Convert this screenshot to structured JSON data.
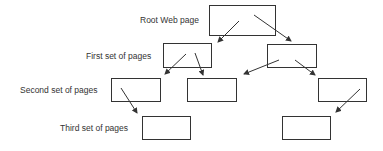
{
  "diagram": {
    "labels": {
      "root": "Root Web page",
      "first": "First set of pages",
      "second": "Second set of pages",
      "third": "Third set of pages"
    },
    "colors": {
      "stroke": "#333333",
      "text": "#333333",
      "background": "#ffffff"
    },
    "levels": [
      {
        "name": "Root Web page",
        "nodes": 1
      },
      {
        "name": "First set of pages",
        "nodes": 2
      },
      {
        "name": "Second set of pages",
        "nodes": 3
      },
      {
        "name": "Third set of pages",
        "nodes": 2
      }
    ],
    "edges": [
      [
        "root",
        "first-left"
      ],
      [
        "root",
        "first-right"
      ],
      [
        "first-left",
        "second-1"
      ],
      [
        "first-left",
        "second-2"
      ],
      [
        "first-right",
        "second-2"
      ],
      [
        "first-right",
        "second-3"
      ],
      [
        "second-1",
        "third-1"
      ],
      [
        "second-3",
        "third-2"
      ]
    ]
  }
}
